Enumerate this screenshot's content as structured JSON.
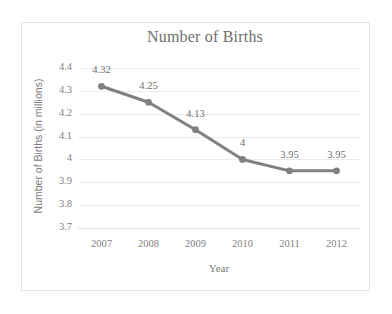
{
  "chart_data": {
    "type": "line",
    "title": "Number of Births",
    "xlabel": "Year",
    "ylabel": "Number of Births (in millions)",
    "categories": [
      "2007",
      "2008",
      "2009",
      "2010",
      "2011",
      "2012"
    ],
    "values": [
      4.32,
      4.25,
      4.13,
      4,
      3.95,
      3.95
    ],
    "point_labels": [
      "4.32",
      "4.25",
      "4.13",
      "4",
      "3.95",
      "3.95"
    ],
    "yticks": [
      "4.4",
      "4.3",
      "4.2",
      "4.1",
      "4",
      "3.9",
      "3.8",
      "3.7"
    ],
    "ytick_values": [
      4.4,
      4.3,
      4.2,
      4.1,
      4.0,
      3.9,
      3.8,
      3.7
    ],
    "ylim": [
      3.7,
      4.4
    ],
    "grid": true,
    "legend": false,
    "series_color": "#808080",
    "grid_color": "#ebebeb",
    "text_color": "#7f7f7f",
    "frame_color": "#e3e3e3"
  }
}
